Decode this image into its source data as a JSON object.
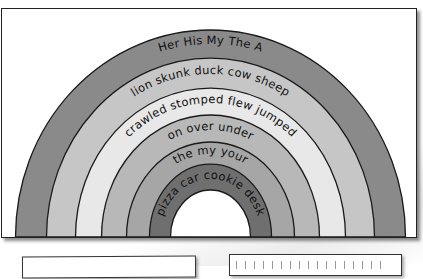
{
  "worksheet": {
    "title": "Rainbow sentence builder",
    "bands": [
      {
        "id": "band-1",
        "label": "Her His My The A",
        "color": "#8a8a8a"
      },
      {
        "id": "band-2",
        "label": "lion skunk duck cow sheep",
        "color": "#c6c6c6"
      },
      {
        "id": "band-3",
        "label": "crawled stomped flew jumped",
        "color": "#e8e8e8"
      },
      {
        "id": "band-4",
        "label": "on over under",
        "color": "#b8b8b8"
      },
      {
        "id": "band-5",
        "label": "the my your",
        "color": "#a6a6a6"
      },
      {
        "id": "band-6",
        "label": "pizza car cookie desk",
        "color": "#6f6f6f"
      }
    ],
    "answer_boxes": [
      {
        "id": "left-box",
        "text": ""
      },
      {
        "id": "right-box",
        "text": ""
      }
    ]
  },
  "colors": {
    "outline": "#1a1a1a",
    "background": "#ffffff"
  }
}
